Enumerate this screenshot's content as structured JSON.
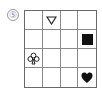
{
  "puzzle": {
    "label": "⑤",
    "rows": 4,
    "cols": 4,
    "cells": [
      [
        {
          "symbol": ""
        },
        {
          "symbol": "triangle-down-outline"
        },
        {
          "symbol": ""
        },
        {
          "symbol": ""
        }
      ],
      [
        {
          "symbol": ""
        },
        {
          "symbol": ""
        },
        {
          "symbol": ""
        },
        {
          "symbol": "square-filled"
        }
      ],
      [
        {
          "symbol": "club-outline"
        },
        {
          "symbol": ""
        },
        {
          "symbol": ""
        },
        {
          "symbol": ""
        }
      ],
      [
        {
          "symbol": ""
        },
        {
          "symbol": ""
        },
        {
          "symbol": ""
        },
        {
          "symbol": "heart-filled"
        }
      ]
    ],
    "colors": {
      "grid_line": "#6a6a6a",
      "symbol": "#111111",
      "label": "#8a8a8a"
    }
  }
}
